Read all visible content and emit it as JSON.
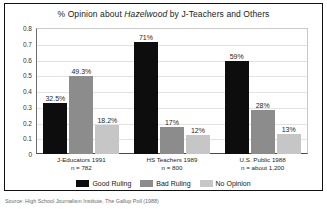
{
  "chart_data": {
    "type": "bar",
    "title_prefix": "% Opinion about ",
    "title_italic": "Hazelwood",
    "title_suffix": " by J-Teachers and Others",
    "title": "% Opinion about Hazelwood by J-Teachers and Others",
    "xlabel": "",
    "ylabel": "",
    "ylim": [
      0,
      0.8
    ],
    "grid": true,
    "legend_position": "bottom",
    "ytick_labels": [
      "0.8",
      "0.7",
      "0.6",
      "0.5",
      "0.4",
      "0.3",
      "0.2",
      "0.1",
      "0"
    ],
    "ytick_values": [
      0.8,
      0.7,
      0.6,
      0.5,
      0.4,
      0.3,
      0.2,
      0.1,
      0
    ],
    "categories": [
      "J-Educators 1991",
      "HS Teachers 1989",
      "U.S. Public 1988"
    ],
    "category_notes": [
      "n = 782",
      "n = 800",
      "n = about 1,200"
    ],
    "series": [
      {
        "name": "Good Ruling",
        "color": "#0d0d0d",
        "values": [
          0.325,
          0.71,
          0.59
        ],
        "labels": [
          "32.5%",
          "71%",
          "59%"
        ]
      },
      {
        "name": "Bad Ruling",
        "color": "#8c8c8c",
        "values": [
          0.493,
          0.17,
          0.28
        ],
        "labels": [
          "49.3%",
          "17%",
          "28%"
        ]
      },
      {
        "name": "No Opinion",
        "color": "#c6c6c6",
        "values": [
          0.182,
          0.12,
          0.13
        ],
        "labels": [
          "18.2%",
          "12%",
          "13%"
        ]
      }
    ],
    "source": "Source:  High School Journalism Institute, The Gallup Poll (1988)"
  },
  "ytick": {
    "t0": "0.8",
    "t1": "0.7",
    "t2": "0.6",
    "t3": "0.5",
    "t4": "0.4",
    "t5": "0.3",
    "t6": "0.2",
    "t7": "0.1",
    "t8": "0"
  }
}
